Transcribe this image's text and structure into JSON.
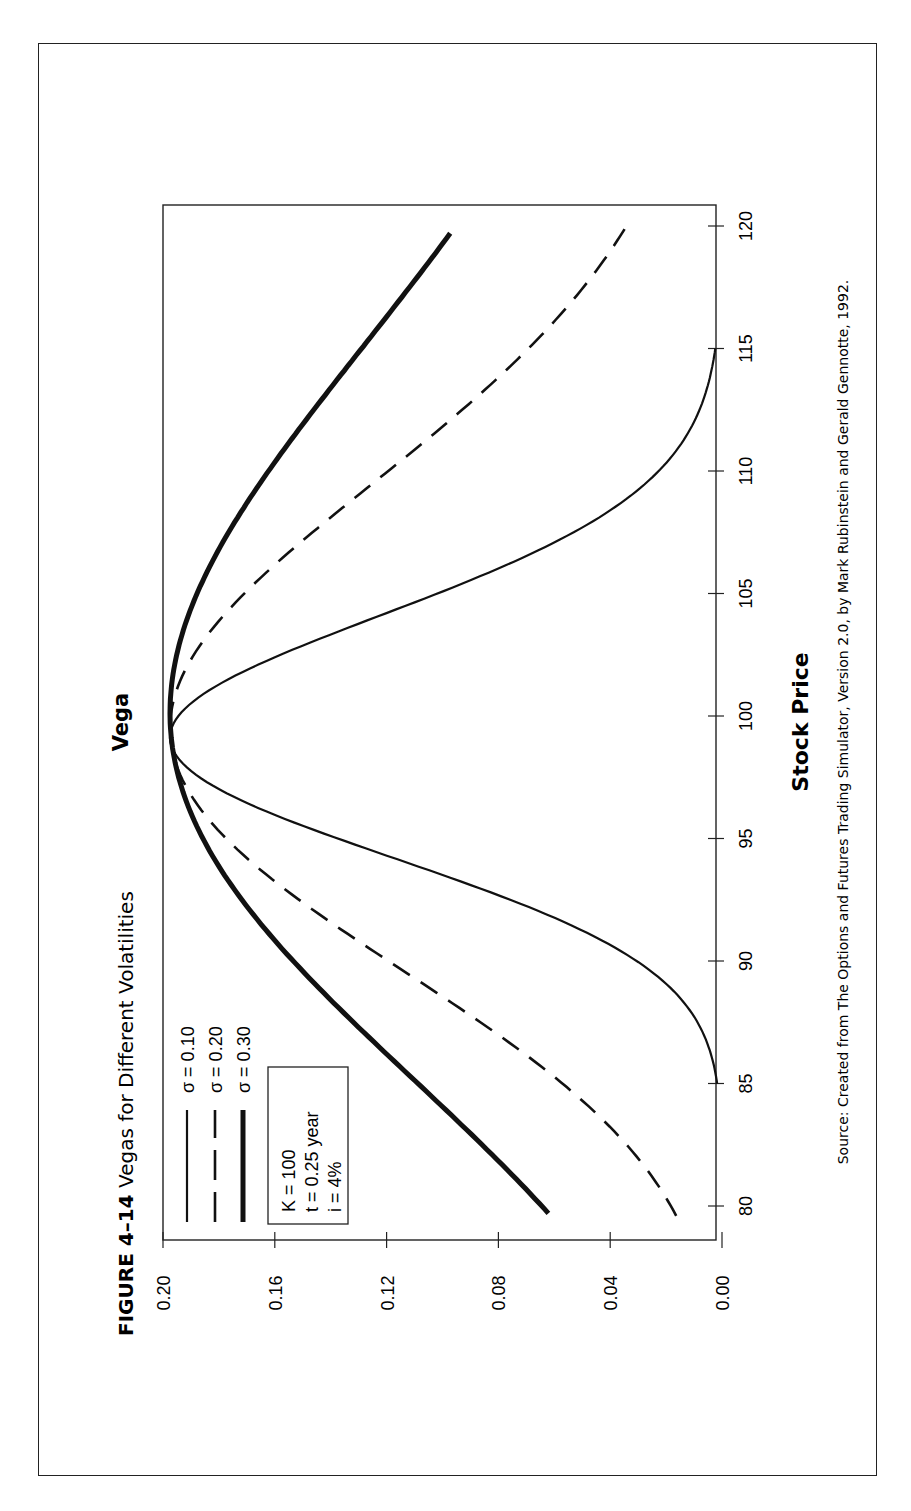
{
  "figure": {
    "number": "FIGURE 4–14",
    "title": "Vegas for Different Volatilities",
    "source": "Source: Created from The Options and Futures Trading Simulator, Version 2.0, by Mark Rubinstein and Gerald Gennotte, 1992."
  },
  "legend": {
    "items": [
      {
        "label": "σ = 0.10",
        "style": "thin"
      },
      {
        "label": "σ = 0.20",
        "style": "dashed"
      },
      {
        "label": "σ = 0.30",
        "style": "thick"
      }
    ],
    "params": [
      "K = 100",
      "t = 0.25 year",
      "i = 4%"
    ]
  },
  "chart_data": {
    "type": "line",
    "title": "Vegas for Different Volatilities",
    "xlabel": "Stock Price",
    "ylabel": "Vega",
    "xlim": [
      79,
      121
    ],
    "ylim": [
      0.0,
      0.2
    ],
    "x_ticks": [
      80,
      85,
      90,
      95,
      100,
      105,
      110,
      115,
      120
    ],
    "y_ticks": [
      "0.00",
      "0.04",
      "0.08",
      "0.12",
      "0.16",
      "0.20"
    ],
    "grid": false,
    "legend_position": "upper-left (inside plot)",
    "orientation": "page rotated 90° counter-clockwise",
    "x": [
      80,
      85,
      90,
      95,
      98.8,
      100,
      105,
      110,
      115,
      120
    ],
    "series": [
      {
        "name": "σ = 0.10",
        "style": "thin solid",
        "x_range": [
          85,
          115
        ],
        "values": [
          null,
          0.003,
          0.04,
          0.145,
          0.196,
          0.188,
          0.095,
          0.025,
          0.003,
          null
        ]
      },
      {
        "name": "σ = 0.20",
        "style": "dashed",
        "x_range": [
          79.6,
          120
        ],
        "values": [
          0.019,
          0.06,
          0.122,
          0.175,
          0.196,
          0.195,
          0.17,
          0.118,
          0.07,
          0.036
        ]
      },
      {
        "name": "σ = 0.30",
        "style": "thick solid",
        "x_range": [
          79.7,
          119.7
        ],
        "values": [
          0.062,
          0.108,
          0.155,
          0.186,
          0.196,
          0.196,
          0.185,
          0.16,
          0.128,
          0.096
        ]
      }
    ],
    "params": {
      "K": 100,
      "t": 0.25,
      "i": 0.04
    }
  }
}
